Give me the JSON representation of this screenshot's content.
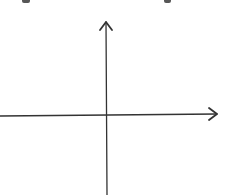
{
  "diagram": {
    "type": "coordinate-axes",
    "stroke_color": "#333333",
    "background": "#ffffff",
    "origin": {
      "x": 107,
      "y": 115
    },
    "x_axis": {
      "x1": 0,
      "y1": 116,
      "x2": 217,
      "y2": 114,
      "arrow": "right"
    },
    "y_axis": {
      "x1": 107,
      "y1": 195,
      "x2": 106,
      "y2": 22,
      "arrow": "up"
    },
    "labels": []
  },
  "cropped_fragments": [
    {
      "x": 22,
      "width": 8
    },
    {
      "x": 164,
      "width": 7
    }
  ]
}
